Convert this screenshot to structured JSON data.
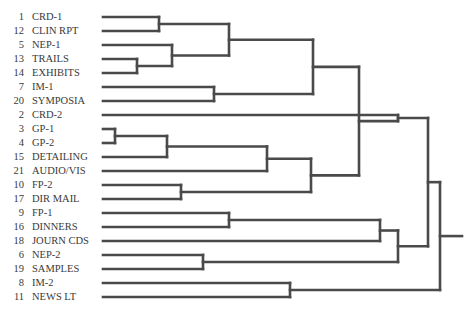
{
  "diagram": {
    "type": "dendrogram",
    "line_color": "#4a4a4a",
    "leaves": [
      {
        "id": "1",
        "label": "CRD-1"
      },
      {
        "id": "12",
        "label": "CLIN RPT"
      },
      {
        "id": "5",
        "label": "NEP-1"
      },
      {
        "id": "13",
        "label": "TRAILS"
      },
      {
        "id": "14",
        "label": "EXHIBITS"
      },
      {
        "id": "7",
        "label": "IM-1"
      },
      {
        "id": "20",
        "label": "SYMPOSIA"
      },
      {
        "id": "2",
        "label": "CRD-2"
      },
      {
        "id": "3",
        "label": "GP-1"
      },
      {
        "id": "4",
        "label": "GP-2"
      },
      {
        "id": "15",
        "label": "DETAILING"
      },
      {
        "id": "21",
        "label": "AUDIO/VIS"
      },
      {
        "id": "10",
        "label": "FP-2"
      },
      {
        "id": "17",
        "label": "DIR MAIL"
      },
      {
        "id": "9",
        "label": "FP-1"
      },
      {
        "id": "16",
        "label": "DINNERS"
      },
      {
        "id": "18",
        "label": "JOURN CDS"
      },
      {
        "id": "6",
        "label": "NEP-2"
      },
      {
        "id": "19",
        "label": "SAMPLES"
      },
      {
        "id": "8",
        "label": "IM-2"
      },
      {
        "id": "11",
        "label": "NEWS LT"
      }
    ],
    "merges": [
      {
        "name": "A",
        "children": [
          "L0",
          "L1"
        ],
        "x": 159
      },
      {
        "name": "B",
        "children": [
          "L3",
          "L4"
        ],
        "x": 137
      },
      {
        "name": "C",
        "children": [
          "L2",
          "B"
        ],
        "x": 172
      },
      {
        "name": "D",
        "children": [
          "A",
          "C"
        ],
        "x": 229
      },
      {
        "name": "E",
        "children": [
          "L5",
          "L6"
        ],
        "x": 214
      },
      {
        "name": "F",
        "children": [
          "D",
          "E"
        ],
        "x": 313
      },
      {
        "name": "G",
        "children": [
          "L8",
          "L9"
        ],
        "x": 115
      },
      {
        "name": "H",
        "children": [
          "G",
          "L10"
        ],
        "x": 167
      },
      {
        "name": "I",
        "children": [
          "L12",
          "L13"
        ],
        "x": 181
      },
      {
        "name": "J",
        "children": [
          "H",
          "L11"
        ],
        "x": 267
      },
      {
        "name": "K",
        "children": [
          "J",
          "I"
        ],
        "x": 311
      },
      {
        "name": "L",
        "children": [
          "F",
          "K"
        ],
        "x": 359
      },
      {
        "name": "M",
        "children": [
          "L14",
          "L15"
        ],
        "x": 229
      },
      {
        "name": "N",
        "children": [
          "M",
          "L16"
        ],
        "x": 380
      },
      {
        "name": "O",
        "children": [
          "L17",
          "L18"
        ],
        "x": 203
      },
      {
        "name": "P",
        "children": [
          "L",
          "L7"
        ],
        "x": 398
      },
      {
        "name": "Q",
        "children": [
          "N",
          "O"
        ],
        "x": 398
      },
      {
        "name": "R",
        "children": [
          "P",
          "Q"
        ],
        "x": 428
      },
      {
        "name": "S",
        "children": [
          "L19",
          "L20"
        ],
        "x": 290
      },
      {
        "name": "ROOT",
        "children": [
          "R",
          "S"
        ],
        "x": 440
      }
    ],
    "root_tail_x": 462
  }
}
